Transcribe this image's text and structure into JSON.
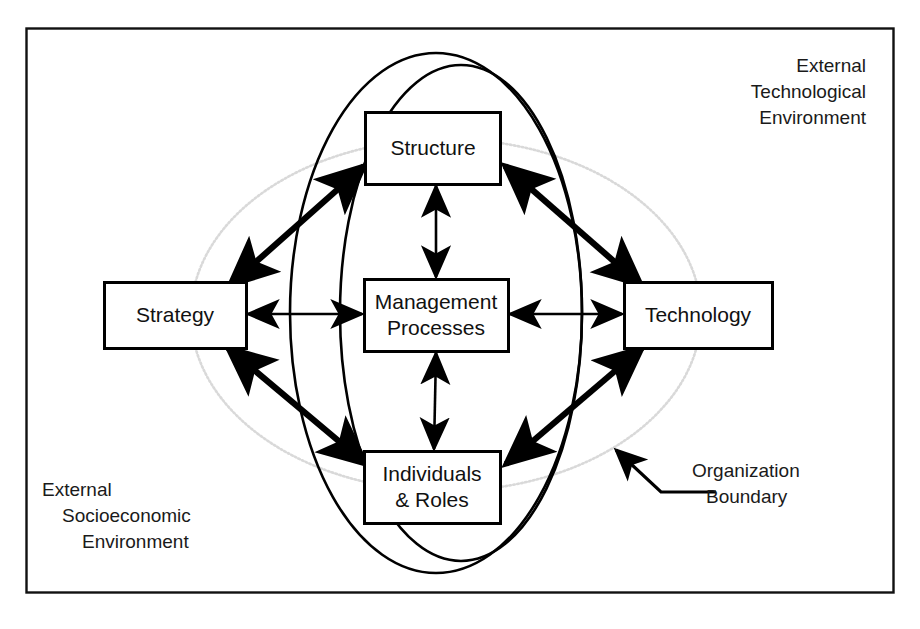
{
  "figure": {
    "type": "organizational-systems-diagram",
    "frame_color": "#111111",
    "line_color": "#000000",
    "boundary_color": "#d8d8d8",
    "background": "#ffffff"
  },
  "nodes": [
    {
      "id": "structure",
      "label": "Structure",
      "lines": [
        "Structure"
      ],
      "x": 433,
      "y": 148,
      "w": 135,
      "h": 72
    },
    {
      "id": "management_processes",
      "label": "Management Processes",
      "lines": [
        "Management",
        "Processes"
      ],
      "x": 436,
      "y": 315,
      "w": 144,
      "h": 72
    },
    {
      "id": "individuals_roles",
      "label": "Individuals & Roles",
      "lines": [
        "Individuals",
        "& Roles"
      ],
      "x": 432,
      "y": 487,
      "w": 136,
      "h": 72
    },
    {
      "id": "strategy",
      "label": "Strategy",
      "lines": [
        "Strategy"
      ],
      "x": 175,
      "y": 315,
      "w": 142,
      "h": 66
    },
    {
      "id": "technology",
      "label": "Technology",
      "lines": [
        "Technology"
      ],
      "x": 698,
      "y": 315,
      "w": 148,
      "h": 66
    }
  ],
  "connections": [
    {
      "from": "strategy",
      "to": "structure",
      "style": "double-headed-thick"
    },
    {
      "from": "structure",
      "to": "technology",
      "style": "double-headed-thick"
    },
    {
      "from": "strategy",
      "to": "individuals_roles",
      "style": "double-headed-thick"
    },
    {
      "from": "individuals_roles",
      "to": "technology",
      "style": "double-headed-thick"
    },
    {
      "from": "management_processes",
      "to": "structure",
      "style": "double-headed-thin"
    },
    {
      "from": "management_processes",
      "to": "individuals_roles",
      "style": "double-headed-thin"
    },
    {
      "from": "management_processes",
      "to": "strategy",
      "style": "double-headed-thin"
    },
    {
      "from": "management_processes",
      "to": "technology",
      "style": "double-headed-thin"
    }
  ],
  "ellipses": {
    "outer": {
      "cx": 436,
      "cy": 313,
      "rx": 146,
      "ry": 260,
      "stroke": "#000000"
    },
    "inner": {
      "cx": 461,
      "cy": 313,
      "rx": 121,
      "ry": 248,
      "stroke": "#000000"
    },
    "boundary": {
      "cx": 446,
      "cy": 315,
      "rx": 255,
      "ry": 176,
      "stroke": "#d9d9d9"
    }
  },
  "labels": {
    "external_technological": {
      "name": "External Technological Environment",
      "lines": [
        "External",
        "Technological",
        "Environment"
      ],
      "align": "right",
      "x": 866,
      "y": 72
    },
    "external_socioeconomic": {
      "name": "External Socioeconomic Environment",
      "lines": [
        "External",
        "Socioeconomic",
        "Environment"
      ],
      "align": "left",
      "x": 42,
      "y": 490
    },
    "organization_boundary": {
      "name": "Organization Boundary",
      "lines": [
        "Organization",
        "Boundary"
      ],
      "align": "left",
      "x": 690,
      "y": 470
    }
  },
  "callout": {
    "target_x": 612,
    "target_y": 446,
    "elbow_x": 661,
    "elbow_y": 492,
    "end_x": 716,
    "end_y": 492
  }
}
